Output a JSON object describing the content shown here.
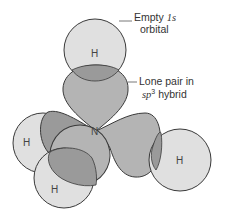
{
  "diagram": {
    "center_atom": "N",
    "atoms": [
      {
        "id": "h-top",
        "label": "H"
      },
      {
        "id": "h-left",
        "label": "H"
      },
      {
        "id": "h-bottom",
        "label": "H"
      },
      {
        "id": "h-right",
        "label": "H"
      }
    ],
    "labels": {
      "empty_orbital_line1_a": "Empty ",
      "empty_orbital_line1_b": "1s",
      "empty_orbital_line2": "orbital",
      "lone_pair_line1": "Lone pair in",
      "lone_pair_line2_a": "sp",
      "lone_pair_line2_sup": "3",
      "lone_pair_line2_b": " hybrid"
    },
    "colors": {
      "h_orbital_fill": "#e0e0e0",
      "lobe_fill": "#b4b4b4",
      "overlap_fill": "#9a9a9a",
      "outline": "#3a3a3a"
    }
  }
}
